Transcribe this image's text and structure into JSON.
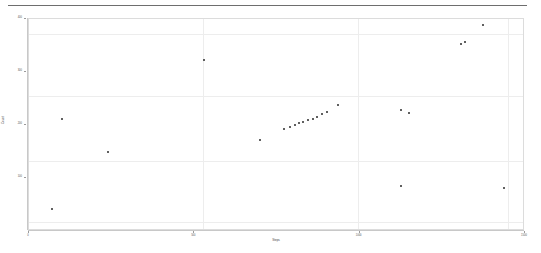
{
  "chart_data": {
    "type": "scatter",
    "title": "",
    "xlabel": "Steps",
    "ylabel": "Count",
    "xlim": [
      0,
      1500
    ],
    "ylim": [
      0,
      400
    ],
    "grid": true,
    "legend": null,
    "xticks": [
      "0",
      "500",
      "1000",
      "1500"
    ],
    "yticks": [
      "400",
      "300",
      "200",
      "100"
    ],
    "marker": "point",
    "marker_color": "#2b2b2b",
    "points": [
      {
        "x": 70,
        "y": 42
      },
      {
        "x": 240,
        "y": 150
      },
      {
        "x": 100,
        "y": 212
      },
      {
        "x": 530,
        "y": 322
      },
      {
        "x": 700,
        "y": 172
      },
      {
        "x": 770,
        "y": 192
      },
      {
        "x": 790,
        "y": 196
      },
      {
        "x": 805,
        "y": 200
      },
      {
        "x": 818,
        "y": 203
      },
      {
        "x": 830,
        "y": 206
      },
      {
        "x": 845,
        "y": 209
      },
      {
        "x": 858,
        "y": 212
      },
      {
        "x": 872,
        "y": 216
      },
      {
        "x": 885,
        "y": 220
      },
      {
        "x": 900,
        "y": 224
      },
      {
        "x": 935,
        "y": 238
      },
      {
        "x": 1125,
        "y": 228
      },
      {
        "x": 1150,
        "y": 222
      },
      {
        "x": 1125,
        "y": 85
      },
      {
        "x": 1305,
        "y": 352
      },
      {
        "x": 1320,
        "y": 356
      },
      {
        "x": 1372,
        "y": 388
      },
      {
        "x": 1437,
        "y": 82
      }
    ]
  },
  "top_rule": {
    "name": "header-rule",
    "color": "#6e6e6e"
  },
  "panel": {
    "border_color": "#dcdcdc",
    "grid_color": "#ededed",
    "background": "#ffffff"
  }
}
